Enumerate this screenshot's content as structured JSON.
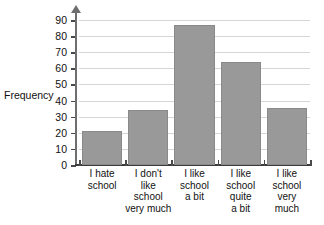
{
  "chart_data": {
    "type": "bar",
    "title": "",
    "xlabel": "",
    "ylabel": "Frequency",
    "categories": [
      "I hate school",
      "I don't like school very much",
      "I like school a bit",
      "I like school quite a bit",
      "I like school very much"
    ],
    "category_lines": [
      [
        "I hate",
        "school"
      ],
      [
        "I don't",
        "like",
        "school",
        "very much"
      ],
      [
        "I like",
        "school",
        "a bit"
      ],
      [
        "I like",
        "school",
        "quite",
        "a bit"
      ],
      [
        "I like",
        "school",
        "very",
        "much"
      ]
    ],
    "values": [
      21,
      34,
      87,
      64,
      35.5
    ],
    "ylim": [
      0,
      95
    ],
    "ytick_labels": [
      "0",
      "10",
      "20",
      "30",
      "40",
      "50",
      "60",
      "70",
      "80",
      "90"
    ],
    "ytick_values": [
      0,
      10,
      20,
      30,
      40,
      50,
      60,
      70,
      80,
      90
    ],
    "grid": true,
    "legend": false,
    "colors": {
      "bar_fill": "#999999",
      "bar_edge": "#8a8a8a",
      "gridline": "#d6d6d6",
      "axis": "#3a3a3a",
      "y_axis": "#6e6e6e",
      "text": "#111111",
      "background": "#ffffff"
    }
  }
}
